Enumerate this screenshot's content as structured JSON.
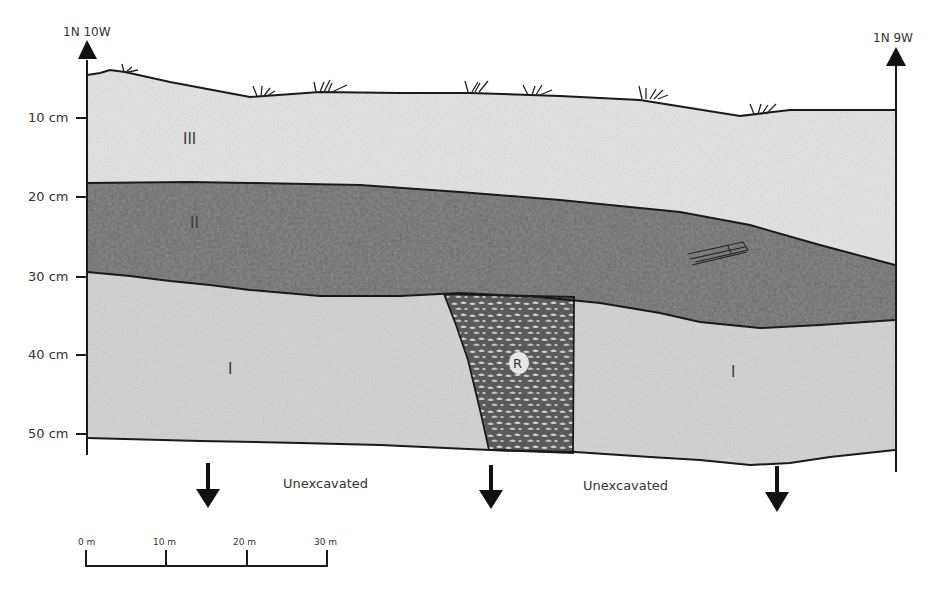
{
  "profile": {
    "left_stake": "1N 10W",
    "right_stake": "1N 9W",
    "depth_ticks": [
      "10 cm",
      "20 cm",
      "30 cm",
      "40 cm",
      "50 cm"
    ],
    "layers": {
      "layer_3": "III",
      "layer_2": "II",
      "layer_1_left": "I",
      "layer_1_right": "I",
      "feature": "R"
    },
    "unexcavated_left": "Unexcavated",
    "unexcavated_right": "Unexcavated"
  },
  "scale_bar": {
    "ticks": [
      "0 m",
      "10 m",
      "20 m",
      "30 m"
    ]
  },
  "colors": {
    "layer_3_fill": "#e6e6e6",
    "layer_2_fill": "#8e8e8e",
    "layer_1_fill": "#d6d6d6",
    "feature_dark": "#555555",
    "feature_light": "#c8c8c8",
    "line": "#1a1a1a"
  }
}
